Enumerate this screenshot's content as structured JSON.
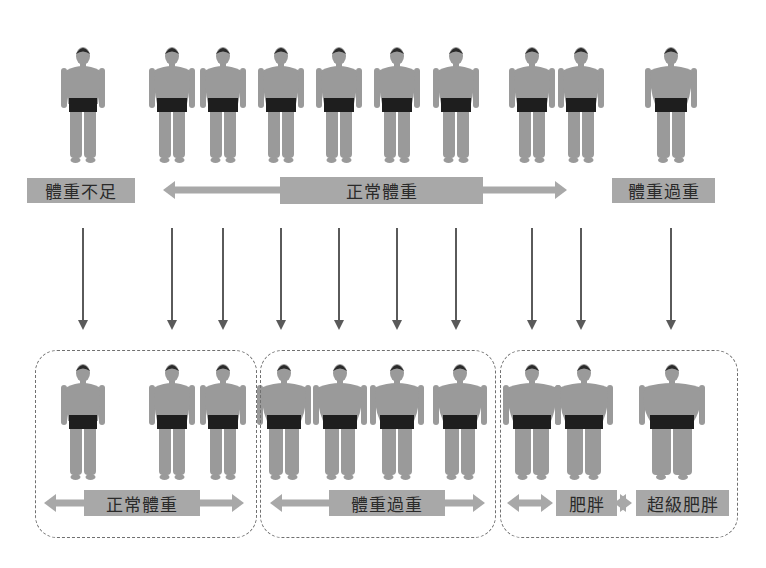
{
  "colors": {
    "label_bg": "#a8a8a8",
    "arrow": "#5a5a5a",
    "h_arrow": "#a8a8a8",
    "body": "#9a9a9a",
    "shorts": "#1e1e1e",
    "hair": "#2a2a2a",
    "dashed_border": "#707070"
  },
  "top_row": {
    "figures": [
      {
        "x": 83,
        "build": "thin"
      },
      {
        "x": 172,
        "build": "normal"
      },
      {
        "x": 223,
        "build": "normal"
      },
      {
        "x": 281,
        "build": "normal"
      },
      {
        "x": 339,
        "build": "normal"
      },
      {
        "x": 397,
        "build": "normal"
      },
      {
        "x": 456,
        "build": "normal"
      },
      {
        "x": 532,
        "build": "normal"
      },
      {
        "x": 581,
        "build": "normal"
      },
      {
        "x": 671,
        "build": "stocky"
      }
    ],
    "labels": {
      "underweight": "體重不足",
      "normal": "正常體重",
      "overweight": "體重過重"
    }
  },
  "bottom_row": {
    "figures": [
      {
        "x": 83,
        "build": "thin"
      },
      {
        "x": 172,
        "build": "normal"
      },
      {
        "x": 223,
        "build": "normal"
      },
      {
        "x": 284,
        "build": "heavy"
      },
      {
        "x": 340,
        "build": "heavy"
      },
      {
        "x": 397,
        "build": "heavy"
      },
      {
        "x": 460,
        "build": "heavy"
      },
      {
        "x": 532,
        "build": "obese"
      },
      {
        "x": 584,
        "build": "obese"
      },
      {
        "x": 672,
        "build": "super"
      }
    ],
    "groups": [
      {
        "label": "正常體重"
      },
      {
        "label": "體重過重"
      },
      {
        "label": "肥胖",
        "label2": "超級肥胖"
      }
    ]
  }
}
